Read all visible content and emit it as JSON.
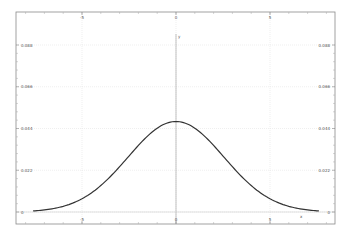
{
  "chart_data": {
    "type": "line",
    "title": "",
    "xlabel": "x",
    "ylabel": "y",
    "note": "Source image is too low-resolution to read tick labels reliably. X tick labels (-5, 0, 5) and Y tick labels (0.088, 0.066, 0.044, 0.022, 0) are best-effort guesses from blurry text; the series values below are pixel-fitted estimates of a Gaussian shape, not readings from the axes.",
    "grid": true,
    "legend": null,
    "x_ticks": [
      {
        "label": "-5",
        "value": -5
      },
      {
        "label": "0",
        "value": 0
      },
      {
        "label": "5",
        "value": 5
      }
    ],
    "y_ticks": [
      {
        "label": "0",
        "value": 0
      },
      {
        "label": "0.022",
        "value": 0.022
      },
      {
        "label": "0.044",
        "value": 0.044
      },
      {
        "label": "0.066",
        "value": 0.066
      },
      {
        "label": "0.088",
        "value": 0.088
      }
    ],
    "xlim": [
      -8.2,
      8.7
    ],
    "ylim": [
      -0.006,
      0.1
    ],
    "series": [
      {
        "name": "normal density",
        "color": "#333333",
        "x": [
          -7.5,
          -7,
          -6.5,
          -6,
          -5.5,
          -5,
          -4.5,
          -4,
          -3.5,
          -3,
          -2.5,
          -2,
          -1.5,
          -1,
          -0.5,
          0,
          0.5,
          1,
          1.5,
          2,
          2.5,
          3,
          3.5,
          4,
          4.5,
          5,
          5.5,
          6,
          6.5,
          7,
          7.5
        ],
        "y": [
          0.0003,
          0.0006,
          0.0011,
          0.0019,
          0.0031,
          0.0048,
          0.0071,
          0.01,
          0.0135,
          0.0175,
          0.0218,
          0.0262,
          0.0304,
          0.034,
          0.0367,
          0.0477,
          0.0367,
          0.034,
          0.0304,
          0.0262,
          0.0218,
          0.0175,
          0.0135,
          0.01,
          0.0071,
          0.0048,
          0.0031,
          0.0019,
          0.0011,
          0.0006,
          0.0003
        ]
      }
    ],
    "peak": {
      "x": 0,
      "y": 0.0477
    }
  },
  "axes": {
    "x_axis_label": "x",
    "y_axis_label": "y"
  }
}
